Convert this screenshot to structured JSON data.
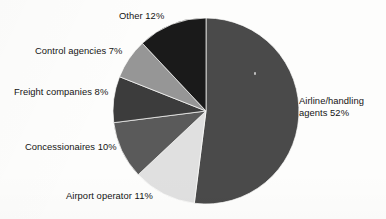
{
  "chart_data": {
    "type": "pie",
    "title": "",
    "subtitle": "",
    "xlabel": "",
    "ylabel": "",
    "legend_position": "none",
    "grid": false,
    "labels_outside": true,
    "total": 100,
    "units": "%",
    "categories": [
      "Airline/handling agents",
      "Airport operator",
      "Concessionaires",
      "Freight companies",
      "Control agencies",
      "Other"
    ],
    "values": [
      52,
      11,
      10,
      8,
      7,
      12
    ],
    "colors": [
      "#4a4a4a",
      "#e0e0e0",
      "#5a5a5a",
      "#3c3c3c",
      "#969696",
      "#1a1a1a"
    ],
    "start_angle_deg": 0,
    "direction": "clockwise",
    "geometry": {
      "cx": 206,
      "cy": 111,
      "r": 93
    },
    "slices": [
      {
        "name": "Airline/handling agents",
        "value": 52,
        "label": "Airline/handling agents 52%",
        "color": "#4a4a4a"
      },
      {
        "name": "Airport operator",
        "value": 11,
        "label": "Airport operator 11%",
        "color": "#e0e0e0"
      },
      {
        "name": "Concessionaires",
        "value": 10,
        "label": "Concessionaires 10%",
        "color": "#5a5a5a"
      },
      {
        "name": "Freight companies",
        "value": 8,
        "label": "Freight companies 8%",
        "color": "#3c3c3c"
      },
      {
        "name": "Control agencies",
        "value": 7,
        "label": "Control agencies 7%",
        "color": "#969696"
      },
      {
        "name": "Other",
        "value": 12,
        "label": "Other 12%",
        "color": "#1a1a1a"
      }
    ]
  },
  "labels": {
    "other": "Other 12%",
    "control_agencies": "Control agencies 7%",
    "freight_companies": "Freight companies 8%",
    "concessionaires": "Concessionaires 10%",
    "airport_operator": "Airport operator 11%",
    "airline_line1": "Airline/handling",
    "airline_line2": "agents 52%"
  },
  "palette": {
    "background": "#fdfdfc",
    "text": "#141414",
    "slice_border": "#fdfdfc"
  }
}
